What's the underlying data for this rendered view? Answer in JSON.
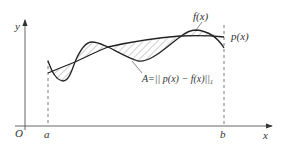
{
  "diagram": {
    "labels": {
      "y_axis": "y",
      "x_axis": "x",
      "origin": "O",
      "a": "a",
      "b": "b",
      "f": "f(x)",
      "p": "p(x)",
      "area": "A=|| p(x) − f(x)||",
      "area_sub": "1"
    },
    "colors": {
      "stroke": "#222222",
      "axis": "#555555",
      "hatch": "#777777"
    }
  }
}
